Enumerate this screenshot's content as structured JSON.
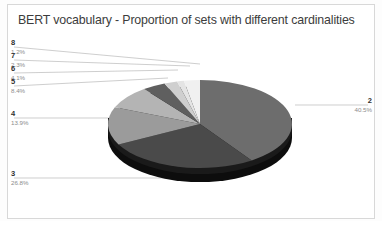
{
  "chart_data": {
    "type": "pie",
    "title": "BERT vocabulary - Proportion of sets with different cardinalities",
    "xlabel": "",
    "ylabel": "",
    "grid": false,
    "legend_position": "none",
    "labels_position": "callout-leader-lines",
    "three_d": true,
    "categories": [
      "2",
      "3",
      "4",
      "5",
      "6",
      "7",
      "8"
    ],
    "values": [
      40.5,
      26.8,
      13.9,
      8.4,
      4.1,
      2.3,
      1.2
    ],
    "value_labels": [
      "40.5%",
      "26.8%",
      "13.9%",
      "8.4%",
      "4.1%",
      "2.3%",
      "1.2%"
    ],
    "slice_colors": [
      "#6d6d6d",
      "#4a4a4a",
      "#9b9b9b",
      "#b4b4b4",
      "#5f5f5f",
      "#cfcfcf",
      "#e4e4e4"
    ],
    "start_angle_deg": 0,
    "direction": "clockwise",
    "slices": [
      {
        "category": "2",
        "value": 40.5,
        "value_label": "40.5%",
        "color": "#6d6d6d"
      },
      {
        "category": "3",
        "value": 26.8,
        "value_label": "26.8%",
        "color": "#4a4a4a"
      },
      {
        "category": "4",
        "value": 13.9,
        "value_label": "13.9%",
        "color": "#9b9b9b"
      },
      {
        "category": "5",
        "value": 8.4,
        "value_label": "8.4%",
        "color": "#b4b4b4"
      },
      {
        "category": "6",
        "value": 4.1,
        "value_label": "4.1%",
        "color": "#5f5f5f"
      },
      {
        "category": "7",
        "value": 2.3,
        "value_label": "2.3%",
        "color": "#cfcfcf"
      },
      {
        "category": "8",
        "value": 1.2,
        "value_label": "1.2%",
        "color": "#e4e4e4"
      }
    ]
  },
  "callouts": {
    "c8": {
      "cat": "8",
      "pct": "1.2%"
    },
    "c7": {
      "cat": "7",
      "pct": "2.3%"
    },
    "c6": {
      "cat": "6",
      "pct": "4.1%"
    },
    "c5": {
      "cat": "5",
      "pct": "8.4%"
    },
    "c4": {
      "cat": "4",
      "pct": "13.9%"
    },
    "c3": {
      "cat": "3",
      "pct": "26.8%"
    },
    "c2": {
      "cat": "2",
      "pct": "40.5%"
    }
  },
  "colors": {
    "title_text": "#3c3c3c",
    "category_text": "#2f2f2f",
    "percent_text": "#8c8c8c",
    "frame_border": "#d8d8d8",
    "leader_line": "#b9b9b9",
    "pie_side": "#101010",
    "background": "#ffffff"
  }
}
